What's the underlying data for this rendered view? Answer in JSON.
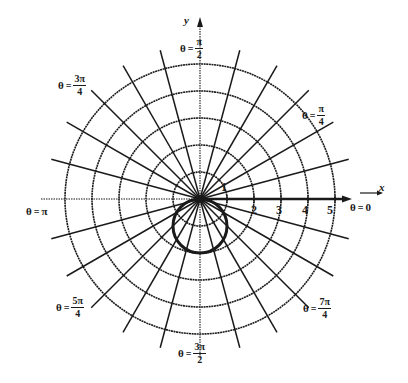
{
  "chart_data": {
    "type": "polar",
    "title": "",
    "axes": {
      "x_label": "x",
      "y_label": "y"
    },
    "radial_ticks": [
      1,
      2,
      3,
      4,
      5
    ],
    "radial_max": 5.7,
    "angular_grid_step_degrees": 15,
    "angle_labels": [
      {
        "angle": "0",
        "text": "θ = 0"
      },
      {
        "angle": "π/4",
        "text": "θ = π/4"
      },
      {
        "angle": "π/2",
        "text": "θ = π/2"
      },
      {
        "angle": "3π/4",
        "text": "θ = 3π/4"
      },
      {
        "angle": "π",
        "text": "θ = π"
      },
      {
        "angle": "5π/4",
        "text": "θ = 5π/4"
      },
      {
        "angle": "3π/2",
        "text": "θ = 3π/2"
      },
      {
        "angle": "7π/4",
        "text": "θ = 7π/4"
      }
    ],
    "curves": [
      {
        "name": "circle",
        "equation": "r = -2 sin θ",
        "center_cartesian": [
          0,
          -1
        ],
        "radius": 1,
        "style": "bold"
      }
    ],
    "annotations": [
      "polar axis arrow along θ = 0",
      "y-axis arrow along θ = π/2"
    ]
  },
  "labels": {
    "x_axis": "x",
    "y_axis": "y",
    "ticks": [
      "1",
      "2",
      "3",
      "4",
      "5"
    ],
    "theta_symbol": "θ",
    "equals": "=",
    "a0": {
      "plain": "0"
    },
    "api": {
      "plain": "π"
    },
    "a1": {
      "num": "π",
      "den": "4"
    },
    "a2": {
      "num": "π",
      "den": "2"
    },
    "a3": {
      "num": "3π",
      "den": "4"
    },
    "a5": {
      "num": "5π",
      "den": "4"
    },
    "a6": {
      "num": "3π",
      "den": "2"
    },
    "a7": {
      "num": "7π",
      "den": "4"
    }
  },
  "style": {
    "ink": "#1a1a1a",
    "background": "#ffffff"
  }
}
